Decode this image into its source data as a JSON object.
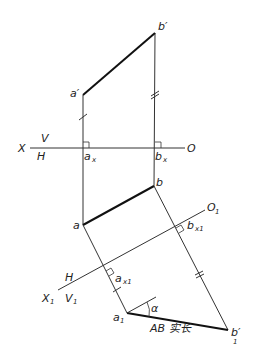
{
  "diagram": {
    "labels": {
      "a_prime": "a′",
      "b_prime": "b′",
      "X": "X",
      "V": "V",
      "H": "H",
      "O": "O",
      "ax": "a",
      "ax_sub": "x",
      "bx": "b",
      "bx_sub": "x",
      "a": "a",
      "b": "b",
      "O1": "O",
      "O1_sub": "1",
      "bx1": "b",
      "bx1_sub": "x1",
      "ax1": "a",
      "ax1_sub": "x1",
      "H2": "H",
      "X1": "X",
      "X1_sub": "1",
      "V1": "V",
      "V1_sub": "1",
      "a1p": "a",
      "a1p_sub": "1",
      "b1p": "b′",
      "b1p_sub": "1",
      "alpha": "α",
      "true_length": "AB 实长"
    },
    "points": {
      "a_prime": [
        83,
        95
      ],
      "b_prime": [
        155,
        33
      ],
      "ax": [
        83,
        148
      ],
      "bx": [
        155,
        148
      ],
      "a": [
        83,
        225
      ],
      "b": [
        154,
        186
      ],
      "ax1": [
        106,
        271
      ],
      "bx1": [
        176,
        228
      ],
      "a1p": [
        127,
        313
      ],
      "b1p": [
        228,
        330
      ]
    }
  }
}
